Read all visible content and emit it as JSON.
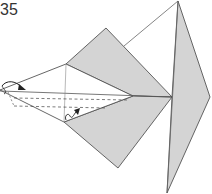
{
  "diagram": {
    "step_number": "35",
    "type": "origami-fold-diagram",
    "colors": {
      "paper_colored_side": "#d4d4d4",
      "paper_white_side": "#ffffff",
      "line": "#555555",
      "arrow": "#222222"
    },
    "annotations": {
      "fold_arrow_left": "valley-fold-arrow",
      "fold_arrow_bottom": "inside-reverse-fold-arrow"
    }
  }
}
